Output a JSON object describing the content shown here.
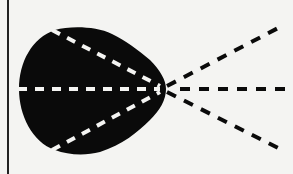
{
  "diagram": {
    "colors": {
      "background": "#f4f4f2",
      "blob": "#0a0a0a",
      "inner_dash": "#f4f4f2",
      "outer_dash": "#0a0a0a",
      "border_line": "#222222"
    },
    "focal_point": {
      "x": 162,
      "y": 89
    },
    "left_border_x": 8,
    "inner_lines": [
      {
        "name": "upper",
        "from": [
          55,
          30
        ]
      },
      {
        "name": "middle",
        "from": [
          20,
          89
        ]
      },
      {
        "name": "lower",
        "from": [
          55,
          150
        ]
      }
    ],
    "outer_lines": [
      {
        "name": "upper",
        "to": [
          282,
          26
        ]
      },
      {
        "name": "middle",
        "to": [
          293,
          89
        ]
      },
      {
        "name": "lower",
        "to": [
          282,
          150
        ]
      }
    ]
  }
}
